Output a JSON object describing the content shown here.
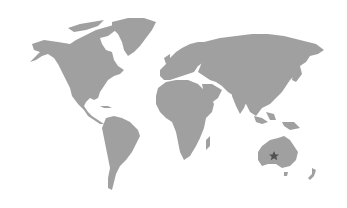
{
  "map": {
    "type": "world-map",
    "style": "grayscale",
    "colors": {
      "background": "#ffffff",
      "land": "#a0a0a0",
      "marker": "#505050"
    },
    "marker": {
      "icon": "star-icon",
      "region": "Western Australia",
      "x": 274,
      "y": 156
    }
  }
}
